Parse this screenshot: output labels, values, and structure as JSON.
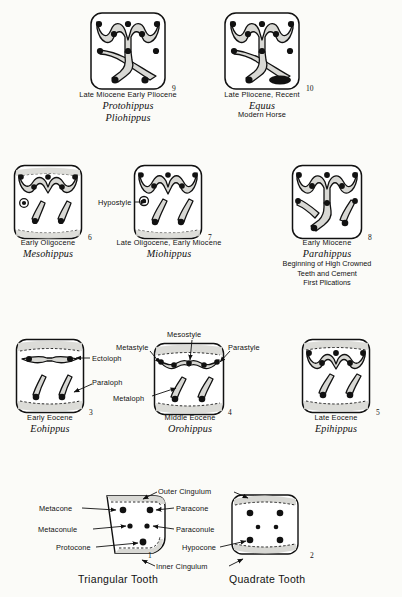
{
  "figure": {
    "type": "scientific-diagram",
    "background_color": "#fbfbf8",
    "ink_color": "#111111",
    "enamel_fill": "#d8d8d4",
    "cusp_color": "#111111"
  },
  "rows": {
    "row1": [
      {
        "index": "9",
        "epoch": "Late Miocene  Early Pliocene",
        "genus": "Protohippus",
        "genus2": "Pliohippus",
        "pattern": "protohippus"
      },
      {
        "index": "10",
        "epoch": "Late  Pliocene,  Recent",
        "genus": "Equus",
        "subtitle": "Modern Horse",
        "pattern": "equus"
      }
    ],
    "row2": [
      {
        "index": "6",
        "epoch": "Early  Oligocene",
        "genus": "Mesohippus",
        "pattern": "mesohippus"
      },
      {
        "index": "7",
        "epoch": "Late Oligocene,  Early Miocene",
        "genus": "Miohippus",
        "pattern": "miohippus"
      },
      {
        "index": "8",
        "epoch": "Early  Miocene",
        "genus": "Parahippus",
        "notes": [
          "Beginning of High Crowned",
          "Teeth and Cement",
          "First Plications"
        ],
        "pattern": "parahippus"
      }
    ],
    "row3": [
      {
        "index": "3",
        "epoch": "Early  Eocene",
        "genus": "Eohippus",
        "pattern": "eohippus"
      },
      {
        "index": "4",
        "epoch": "Middle  Eocene",
        "genus": "Orohippus",
        "pattern": "orohippus"
      },
      {
        "index": "5",
        "epoch": "Late  Eocene",
        "genus": "Epihippus",
        "pattern": "epihippus"
      }
    ],
    "row4": [
      {
        "index": "1",
        "title": "Triangular Tooth",
        "pattern": "triangular"
      },
      {
        "index": "2",
        "title": "Quadrate Tooth",
        "pattern": "quadrate"
      }
    ]
  },
  "annotations": {
    "hypostyle": "Hypostyle",
    "ectoloph": "Ectoloph",
    "paraloph": "Paraloph",
    "metaloph": "Metaloph",
    "metastyle": "Metastyle",
    "mesostyle": "Mesostyle",
    "parastyle": "Parastyle",
    "metacone": "Metacone",
    "paracone": "Paracone",
    "metaconule": "Metaconule",
    "paraconule": "Paraconule",
    "protocone": "Protocone",
    "hypocone": "Hypocone",
    "outer_cingulum": "Outer Cingulum",
    "inner_cingulum": "Inner Cingulum"
  }
}
